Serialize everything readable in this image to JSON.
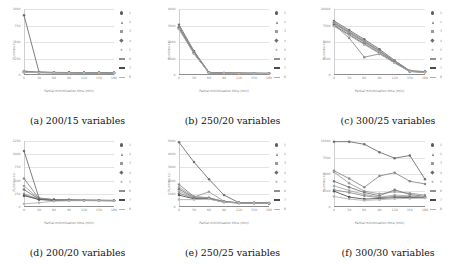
{
  "figure": {
    "layout": "2x3 grid of line charts",
    "xlabel": "Partial minimisation time (min)",
    "ylabel": "Runtime (s)",
    "legend_labels": [
      "1",
      "2",
      "3",
      "4",
      "5",
      "6",
      "7",
      "8"
    ],
    "legend_markers": [
      "circle",
      "triangle",
      "square",
      "diamond",
      "star",
      "dash",
      "dash-bold",
      "dash-light"
    ]
  },
  "chart_data": [
    {
      "type": "line",
      "panel": "a",
      "title": "(a) 200/15 variables",
      "xlabel": "Partial minimisation time (min)",
      "ylabel": "Runtime (s)",
      "x": [
        0,
        30,
        60,
        90,
        120,
        150,
        180
      ],
      "xticklabels": [
        "0",
        "30",
        "60",
        "90",
        "120",
        "150",
        "180"
      ],
      "yticklabels": [
        "1000",
        "750",
        "500",
        "250",
        "0"
      ],
      "ylim": [
        0,
        1000
      ],
      "xlim": [
        0,
        180
      ],
      "grid": true,
      "legend_position": "right",
      "series": [
        {
          "name": "1",
          "values": [
            905,
            45,
            40,
            38,
            36,
            35,
            34
          ]
        },
        {
          "name": "2",
          "values": [
            60,
            42,
            38,
            36,
            35,
            34,
            33
          ]
        },
        {
          "name": "3",
          "values": [
            55,
            40,
            37,
            35,
            34,
            33,
            32
          ]
        },
        {
          "name": "4",
          "values": [
            50,
            40,
            36,
            35,
            34,
            33,
            32
          ]
        },
        {
          "name": "5",
          "values": [
            48,
            38,
            36,
            34,
            33,
            32,
            31
          ]
        },
        {
          "name": "6",
          "values": [
            45,
            38,
            35,
            34,
            33,
            32,
            31
          ]
        },
        {
          "name": "7",
          "values": [
            42,
            36,
            34,
            33,
            32,
            31,
            30
          ]
        },
        {
          "name": "8",
          "values": [
            40,
            35,
            33,
            32,
            31,
            30,
            30
          ]
        }
      ]
    },
    {
      "type": "line",
      "panel": "b",
      "title": "(b) 250/20 variables",
      "xlabel": "Partial minimisation time (min)",
      "ylabel": "Runtime (s)",
      "x": [
        0,
        30,
        60,
        90,
        120,
        150,
        180
      ],
      "xticklabels": [
        "0",
        "30",
        "60",
        "90",
        "120",
        "150",
        "180"
      ],
      "yticklabels": [
        "4000",
        "3000",
        "2000",
        "1000",
        "0"
      ],
      "ylim": [
        0,
        4000
      ],
      "xlim": [
        0,
        180
      ],
      "grid": true,
      "legend_position": "right",
      "series": [
        {
          "name": "1",
          "values": [
            3050,
            1450,
            160,
            120,
            110,
            105,
            100
          ]
        },
        {
          "name": "2",
          "values": [
            2950,
            1400,
            150,
            115,
            108,
            102,
            98
          ]
        },
        {
          "name": "3",
          "values": [
            2900,
            1380,
            145,
            112,
            105,
            100,
            96
          ]
        },
        {
          "name": "4",
          "values": [
            2880,
            1360,
            140,
            110,
            104,
            99,
            95
          ]
        },
        {
          "name": "5",
          "values": [
            2850,
            1340,
            138,
            108,
            102,
            98,
            94
          ]
        },
        {
          "name": "6",
          "values": [
            2830,
            1320,
            135,
            106,
            100,
            96,
            92
          ]
        },
        {
          "name": "7",
          "values": [
            2800,
            1300,
            132,
            104,
            98,
            94,
            90
          ]
        },
        {
          "name": "8",
          "values": [
            2780,
            1280,
            130,
            102,
            96,
            92,
            88
          ]
        }
      ]
    },
    {
      "type": "line",
      "panel": "c",
      "title": "(c) 300/25 variables",
      "xlabel": "Partial minimisation time (min)",
      "ylabel": "Runtime (s)",
      "x": [
        0,
        30,
        60,
        90,
        120,
        150,
        180
      ],
      "xticklabels": [
        "0",
        "30",
        "60",
        "90",
        "120",
        "150",
        "180"
      ],
      "yticklabels": [
        "10000",
        "7500",
        "5000",
        "2500",
        "0"
      ],
      "ylim": [
        0,
        10000
      ],
      "xlim": [
        0,
        180
      ],
      "grid": true,
      "legend_position": "right",
      "series": [
        {
          "name": "1",
          "values": [
            8200,
            6800,
            5400,
            3900,
            2200,
            650,
            520
          ]
        },
        {
          "name": "2",
          "values": [
            8000,
            6600,
            5200,
            3700,
            2100,
            600,
            500
          ]
        },
        {
          "name": "3",
          "values": [
            7900,
            6500,
            5100,
            3600,
            2050,
            580,
            480
          ]
        },
        {
          "name": "4",
          "values": [
            7800,
            6400,
            5000,
            3550,
            2000,
            560,
            470
          ]
        },
        {
          "name": "5",
          "values": [
            7700,
            6300,
            4900,
            3500,
            1950,
            550,
            460
          ]
        },
        {
          "name": "6",
          "values": [
            7600,
            5600,
            2700,
            3200,
            1900,
            540,
            450
          ]
        },
        {
          "name": "7",
          "values": [
            7500,
            6100,
            4700,
            3300,
            1850,
            530,
            440
          ]
        },
        {
          "name": "8",
          "values": [
            7400,
            6000,
            4600,
            3250,
            1800,
            520,
            430
          ]
        }
      ]
    },
    {
      "type": "line",
      "panel": "d",
      "title": "(d) 200/20 variables",
      "xlabel": "Partial minimisation time (min)",
      "ylabel": "Runtime (s)",
      "x": [
        0,
        30,
        60,
        90,
        120,
        150,
        180
      ],
      "xticklabels": [
        "0",
        "30",
        "60",
        "90",
        "120",
        "150",
        "180"
      ],
      "yticklabels": [
        "1250",
        "1000",
        "750",
        "500",
        "250",
        "0"
      ],
      "ylim": [
        0,
        1250
      ],
      "xlim": [
        0,
        180
      ],
      "grid": true,
      "legend_position": "right",
      "series": [
        {
          "name": "1",
          "values": [
            1060,
            170,
            140,
            135,
            130,
            128,
            125
          ]
        },
        {
          "name": "2",
          "values": [
            540,
            160,
            138,
            132,
            128,
            126,
            124
          ]
        },
        {
          "name": "3",
          "values": [
            400,
            155,
            136,
            130,
            127,
            125,
            123
          ]
        },
        {
          "name": "4",
          "values": [
            330,
            150,
            134,
            129,
            126,
            124,
            122
          ]
        },
        {
          "name": "5",
          "values": [
            250,
            148,
            132,
            128,
            125,
            123,
            121
          ]
        },
        {
          "name": "6",
          "values": [
            230,
            145,
            130,
            127,
            124,
            122,
            120
          ]
        },
        {
          "name": "7",
          "values": [
            215,
            140,
            128,
            126,
            123,
            121,
            119
          ]
        },
        {
          "name": "8",
          "values": [
            60,
            80,
            110,
            118,
            120,
            119,
            118
          ]
        }
      ]
    },
    {
      "type": "line",
      "panel": "e",
      "title": "(e) 250/25 variables",
      "xlabel": "Partial minimisation time (min)",
      "ylabel": "Runtime (s)",
      "x": [
        0,
        30,
        60,
        90,
        120,
        150,
        180
      ],
      "xticklabels": [
        "0",
        "30",
        "60",
        "90",
        "120",
        "150",
        "180"
      ],
      "yticklabels": [
        "5000",
        "4000",
        "3000",
        "2000",
        "1000",
        "0"
      ],
      "ylim": [
        0,
        5000
      ],
      "xlim": [
        0,
        180
      ],
      "grid": true,
      "legend_position": "right",
      "series": [
        {
          "name": "1",
          "values": [
            4900,
            3400,
            2100,
            900,
            330,
            310,
            300
          ]
        },
        {
          "name": "2",
          "values": [
            1700,
            800,
            700,
            420,
            320,
            305,
            295
          ]
        },
        {
          "name": "3",
          "values": [
            1500,
            760,
            1150,
            430,
            318,
            302,
            292
          ]
        },
        {
          "name": "4",
          "values": [
            1350,
            720,
            680,
            400,
            315,
            300,
            290
          ]
        },
        {
          "name": "5",
          "values": [
            1200,
            700,
            660,
            390,
            312,
            298,
            288
          ]
        },
        {
          "name": "6",
          "values": [
            1050,
            660,
            640,
            380,
            310,
            296,
            286
          ]
        },
        {
          "name": "7",
          "values": [
            900,
            620,
            620,
            370,
            308,
            294,
            284
          ]
        },
        {
          "name": "8",
          "values": [
            560,
            560,
            600,
            360,
            305,
            292,
            282
          ]
        }
      ]
    },
    {
      "type": "line",
      "panel": "f",
      "title": "(f) 300/30 variables",
      "xlabel": "Partial minimisation time (min)",
      "ylabel": "Runtime (s)",
      "x": [
        0,
        30,
        60,
        90,
        120,
        150,
        180
      ],
      "xticklabels": [
        "0",
        "30",
        "60",
        "90",
        "120",
        "150",
        "180"
      ],
      "yticklabels": [
        "10000",
        "7500",
        "5000",
        "2500",
        "0"
      ],
      "ylim": [
        0,
        10000
      ],
      "xlim": [
        0,
        180
      ],
      "grid": true,
      "legend_position": "right",
      "series": [
        {
          "name": "1",
          "values": [
            9900,
            9900,
            9500,
            8300,
            7400,
            7800,
            4200
          ]
        },
        {
          "name": "2",
          "values": [
            5500,
            4300,
            3000,
            4700,
            5200,
            3900,
            3500
          ]
        },
        {
          "name": "3",
          "values": [
            5300,
            3600,
            2400,
            2000,
            2300,
            2100,
            1800
          ]
        },
        {
          "name": "4",
          "values": [
            3900,
            3000,
            2200,
            1700,
            2600,
            1900,
            1600
          ]
        },
        {
          "name": "5",
          "values": [
            3200,
            2500,
            1900,
            1500,
            1800,
            1700,
            1500
          ]
        },
        {
          "name": "6",
          "values": [
            2600,
            2200,
            1700,
            1400,
            1600,
            1550,
            1450
          ]
        },
        {
          "name": "7",
          "values": [
            2400,
            1500,
            1200,
            1300,
            1400,
            1450,
            1400
          ]
        },
        {
          "name": "8",
          "values": [
            1600,
            1200,
            1000,
            1100,
            1250,
            1300,
            1350
          ]
        }
      ]
    }
  ]
}
